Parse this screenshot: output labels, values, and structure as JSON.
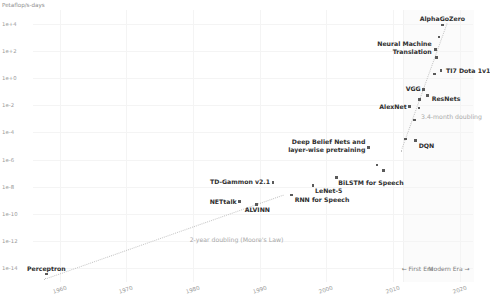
{
  "chart_data": {
    "type": "scatter",
    "title": "",
    "ylabel": "Petaflop/s-days",
    "xlabel": "",
    "xlim": [
      1956,
      2022
    ],
    "ylim_log10": [
      -15,
      5
    ],
    "grid": true,
    "legend_position": "bottom-right",
    "yticks": [
      "1e+4",
      "1e+2",
      "1e+0",
      "1e-2",
      "1e-4",
      "1e-6",
      "1e-8",
      "1e-10",
      "1e-12",
      "1e-14"
    ],
    "ytick_log10": [
      4,
      2,
      0,
      -2,
      -4,
      -6,
      -8,
      -10,
      -12,
      -14
    ],
    "xticks": [
      "1960",
      "1970",
      "1980",
      "1990",
      "2000",
      "2010",
      "2020"
    ],
    "xtick_values": [
      1960,
      1970,
      1980,
      1990,
      2000,
      2010,
      2020
    ],
    "points": [
      {
        "name": "Perceptron",
        "x": 1958.0,
        "y_log10": -14.4,
        "label": "Perceptron",
        "anchor": "above",
        "dx": 0,
        "dy": -2
      },
      {
        "name": "NETtalk",
        "x": 1987.0,
        "y_log10": -9.1,
        "label": "NETtalk",
        "anchor": "left",
        "dx": -3,
        "dy": 0
      },
      {
        "name": "ALVINN",
        "x": 1989.5,
        "y_log10": -9.3,
        "label": "ALVINN",
        "anchor": "above",
        "dx": 1,
        "dy": 9
      },
      {
        "name": "TD-Gammon v2.1",
        "x": 1992.0,
        "y_log10": -7.7,
        "label": "TD-Gammon v2.1",
        "anchor": "left",
        "dx": -3,
        "dy": -1
      },
      {
        "name": "RNN for Speech",
        "x": 1994.8,
        "y_log10": -8.6,
        "label": "RNN for Speech",
        "anchor": "right",
        "dx": 3,
        "dy": 5
      },
      {
        "name": "LeNet-5",
        "x": 1998.0,
        "y_log10": -7.9,
        "label": "LeNet-5",
        "anchor": "right",
        "dx": 2,
        "dy": 6
      },
      {
        "name": "BiLSTM for Speech",
        "x": 2001.5,
        "y_log10": -7.3,
        "label": "BiLSTM for Speech",
        "anchor": "right",
        "dx": 2,
        "dy": 6
      },
      {
        "name": "Deep Belief Nets",
        "x": 2006.3,
        "y_log10": -5.1,
        "label": "Deep Belief Nets and\nlayer-wise pretraining",
        "anchor": "left",
        "dx": -3,
        "dy": -2
      },
      {
        "name": "dqn-cluster-a",
        "x": 2007.6,
        "y_log10": -6.4,
        "label": "",
        "anchor": "right",
        "dx": 0,
        "dy": 0
      },
      {
        "name": "dqn-cluster-b",
        "x": 2008.6,
        "y_log10": -6.8,
        "label": "",
        "anchor": "right",
        "dx": 0,
        "dy": 0
      },
      {
        "name": "DQN",
        "x": 2013.4,
        "y_log10": -4.6,
        "label": "DQN",
        "anchor": "right",
        "dx": 3,
        "dy": 5
      },
      {
        "name": "dqn-pair",
        "x": 2011.9,
        "y_log10": -4.5,
        "label": "",
        "anchor": "right",
        "dx": 0,
        "dy": 0
      },
      {
        "name": "AlexNet",
        "x": 2012.5,
        "y_log10": -2.1,
        "label": "AlexNet",
        "anchor": "left",
        "dx": -3,
        "dy": 0
      },
      {
        "name": "alexnet-pair",
        "x": 2013.9,
        "y_log10": -2.2,
        "label": "",
        "anchor": "right",
        "dx": 0,
        "dy": 0
      },
      {
        "name": "alexnet-low",
        "x": 2013.2,
        "y_log10": -3.1,
        "label": "",
        "anchor": "right",
        "dx": 0,
        "dy": 0
      },
      {
        "name": "VGG",
        "x": 2014.6,
        "y_log10": -0.85,
        "label": "VGG",
        "anchor": "left",
        "dx": -3,
        "dy": -1
      },
      {
        "name": "ResNets",
        "x": 2015.2,
        "y_log10": -1.3,
        "label": "ResNets",
        "anchor": "right",
        "dx": 4,
        "dy": 3
      },
      {
        "name": "vgg-mid",
        "x": 2014.0,
        "y_log10": -1.6,
        "label": "",
        "anchor": "right",
        "dx": 0,
        "dy": 0
      },
      {
        "name": "TI7 Dota 1v1",
        "x": 2017.2,
        "y_log10": 0.55,
        "label": "TI7 Dota 1v1",
        "anchor": "right",
        "dx": 5,
        "dy": 0
      },
      {
        "name": "ti7-left",
        "x": 2016.2,
        "y_log10": 0.3,
        "label": "",
        "anchor": "right",
        "dx": 0,
        "dy": 0
      },
      {
        "name": "Neural Machine Translation",
        "x": 2016.4,
        "y_log10": 2.1,
        "label": "Neural Machine\nTranslation",
        "anchor": "left",
        "dx": -4,
        "dy": -2
      },
      {
        "name": "nmt-lower",
        "x": 2016.5,
        "y_log10": 1.5,
        "label": "",
        "anchor": "right",
        "dx": 0,
        "dy": 0
      },
      {
        "name": "nmt-upper",
        "x": 2016.9,
        "y_log10": 3.0,
        "label": "",
        "anchor": "right",
        "dx": 0,
        "dy": 0
      },
      {
        "name": "AlphaGoZero",
        "x": 2017.4,
        "y_log10": 3.9,
        "label": "AlphaGoZero",
        "anchor": "above",
        "dx": 0,
        "dy": -3
      }
    ],
    "trend_lines": [
      {
        "name": "moores-law",
        "label": "2-year doubling (Moore's Law)",
        "x_start": 1957.6,
        "y_start_log10": -14.8,
        "x_end": 1993.5,
        "y_end_log10": -8.6,
        "label_x": 1979.5,
        "label_y_log10": -11.9
      },
      {
        "name": "modern-era-doubling",
        "label": "3.4-month doubling",
        "x_start": 2011.2,
        "y_start_log10": -5.4,
        "x_end": 2018.1,
        "y_end_log10": 4.0,
        "label_x": 2014.2,
        "label_y_log10": -2.9
      }
    ],
    "era_band": {
      "x_start": 2011.5,
      "x_end": 2022.0
    },
    "annotations": [
      {
        "name": "first-era-legend",
        "text": "← First Era",
        "x": 2011.3,
        "y_log10": -14.05
      },
      {
        "name": "modern-era-legend",
        "text": "Modern Era →",
        "x": 2015.3,
        "y_log10": -14.05
      }
    ],
    "colors": {
      "point": "#5a5a5a",
      "label": "#2f2f2f",
      "trend": "#c4c4c4",
      "trend_label": "#a8a8a8",
      "axis_text": "#9a9a9a",
      "grid": "#f4f4f4",
      "era_band": "#fbfbfb",
      "background": "#ffffff"
    }
  }
}
